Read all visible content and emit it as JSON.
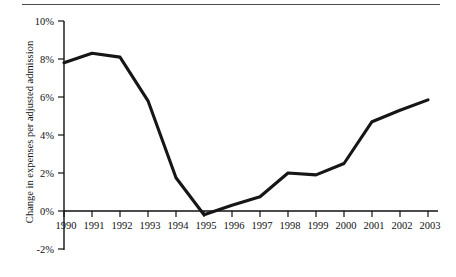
{
  "figure": {
    "has_top_rule": true,
    "background_color": "#ffffff",
    "line_color": "#161616",
    "axis_color": "#111111"
  },
  "chart_data": {
    "type": "line",
    "title": "",
    "subtitle": "",
    "xlabel": "",
    "ylabel": "Change in expenses per adjusted admission",
    "x": [
      1990,
      1991,
      1992,
      1993,
      1994,
      1995,
      1996,
      1997,
      1998,
      1999,
      2000,
      2001,
      2002,
      2003
    ],
    "categories": [
      "1990",
      "1991",
      "1992",
      "1993",
      "1994",
      "1995",
      "1996",
      "1997",
      "1998",
      "1999",
      "2000",
      "2001",
      "2002",
      "2003"
    ],
    "values": [
      7.8,
      8.3,
      8.1,
      5.8,
      1.75,
      -0.2,
      0.3,
      0.75,
      2.0,
      1.9,
      2.5,
      4.7,
      5.3,
      5.85
    ],
    "series": [
      {
        "name": "Change in expenses per adjusted admission",
        "values": [
          7.8,
          8.3,
          8.1,
          5.8,
          1.75,
          -0.2,
          0.3,
          0.75,
          2.0,
          1.9,
          2.5,
          4.7,
          5.3,
          5.85
        ]
      }
    ],
    "ylim": [
      -2,
      10
    ],
    "xlim": [
      1990,
      2003
    ],
    "ytick_values": [
      -2,
      0,
      2,
      4,
      6,
      8,
      10
    ],
    "ytick_labels": [
      "-2%",
      "0%",
      "2%",
      "4%",
      "6%",
      "8%",
      "10%"
    ],
    "xtick_labels": [
      "1990",
      "1991",
      "1992",
      "1993",
      "1994",
      "1995",
      "1996",
      "1997",
      "1998",
      "1999",
      "2000",
      "2001",
      "2002",
      "2003"
    ],
    "grid": false,
    "legend": false,
    "legend_position": "none",
    "annotations": []
  }
}
